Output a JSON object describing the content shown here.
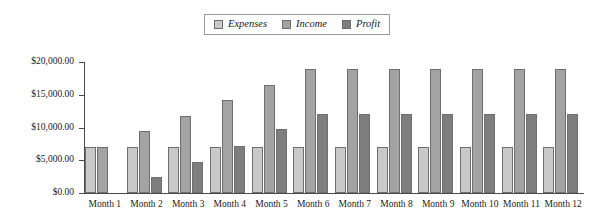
{
  "legend": {
    "position": "top-center",
    "entries": [
      {
        "label": "Expenses",
        "color": "#c9c9c9",
        "swatch_name": "legend-swatch-expenses"
      },
      {
        "label": "Income",
        "color": "#a3a3a3",
        "swatch_name": "legend-swatch-income"
      },
      {
        "label": "Profit",
        "color": "#7e7e7e",
        "swatch_name": "legend-swatch-profit"
      }
    ]
  },
  "axis": {
    "y_tick_labels": [
      "$20,000.00",
      "$15,000.00",
      "$10,000.00",
      "$5,000.00",
      "$0.00"
    ],
    "y_tick_values": [
      20000,
      15000,
      10000,
      5000,
      0
    ]
  },
  "chart_data": {
    "type": "bar",
    "title": "",
    "subtitle": "",
    "xlabel": "",
    "ylabel": "",
    "grid": false,
    "legend_position": "top-center",
    "ylim": [
      0,
      20000
    ],
    "ytick_values": [
      0,
      5000,
      10000,
      15000,
      20000
    ],
    "ytick_labels": [
      "$0.00",
      "$5,000.00",
      "$10,000.00",
      "$15,000.00",
      "$20,000.00"
    ],
    "categories": [
      "Month 1",
      "Month 2",
      "Month 3",
      "Month 4",
      "Month 5",
      "Month 6",
      "Month 7",
      "Month 8",
      "Month 9",
      "Month 10",
      "Month 11",
      "Month 12"
    ],
    "series": [
      {
        "name": "Expenses",
        "color": "#c9c9c9",
        "values": [
          7000,
          7000,
          7000,
          7000,
          7000,
          7000,
          7000,
          7000,
          7000,
          7000,
          7000,
          7000
        ]
      },
      {
        "name": "Income",
        "color": "#a3a3a3",
        "values": [
          7000,
          9500,
          11700,
          14200,
          16500,
          19000,
          19000,
          19000,
          19000,
          19000,
          19000,
          19000
        ]
      },
      {
        "name": "Profit",
        "color": "#7e7e7e",
        "values": [
          0,
          2500,
          4800,
          7200,
          9800,
          12000,
          12000,
          12000,
          12000,
          12000,
          12000,
          12000
        ]
      }
    ]
  }
}
